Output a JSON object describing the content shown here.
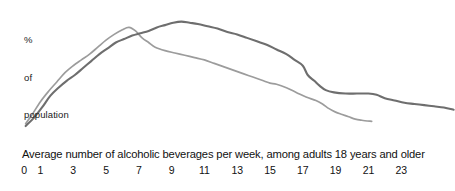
{
  "chart_data": {
    "type": "line",
    "title": "",
    "subtitle": "",
    "xlabel": "Average number of alcoholic beverages per week, among adults 18 years and older",
    "ylabel": "% of population",
    "ylabel_lines": [
      "%",
      "of",
      "population"
    ],
    "grid": false,
    "legend_position": "none",
    "xlim": [
      0,
      26
    ],
    "ylim": [
      0,
      100
    ],
    "xticks": [
      0,
      1,
      3,
      5,
      7,
      9,
      11,
      13,
      15,
      17,
      19,
      21,
      23
    ],
    "xtick_labels": [
      "0",
      "1",
      "3",
      "5",
      "7",
      "9",
      "11",
      "13",
      "15",
      "17",
      "19",
      "21",
      "23"
    ],
    "yticks": [],
    "ytick_labels": [],
    "series": [
      {
        "name": "light-gray-series",
        "color": "#9c9c9c",
        "x": [
          0.1,
          0.5,
          1.0,
          1.5,
          2.0,
          2.5,
          3.0,
          3.5,
          4.0,
          4.5,
          5.0,
          5.5,
          6.0,
          6.4,
          6.8,
          7.2,
          7.6,
          8.0,
          8.6,
          9.2,
          9.8,
          10.4,
          11.0,
          11.6,
          12.2,
          12.8,
          13.4,
          14.0,
          14.6,
          15.0,
          15.4,
          16.0,
          16.6,
          17.2,
          17.8,
          18.2,
          18.6,
          19.0,
          19.4,
          19.8,
          20.2,
          20.6,
          21.2
        ],
        "y": [
          8,
          16,
          27,
          36,
          44,
          52,
          58,
          63,
          68,
          74,
          80,
          85,
          89,
          91,
          88,
          82,
          78,
          74,
          71,
          69,
          67,
          65,
          63,
          60,
          57,
          54,
          51,
          48,
          45,
          43,
          42,
          39,
          35,
          31,
          28,
          25,
          21,
          18,
          16,
          14,
          12,
          11,
          10
        ]
      },
      {
        "name": "dark-gray-series",
        "color": "#6e6e6e",
        "x": [
          0.1,
          0.6,
          1.1,
          1.6,
          2.1,
          2.6,
          3.1,
          3.6,
          4.1,
          4.6,
          5.1,
          5.6,
          6.1,
          6.6,
          7.1,
          7.6,
          8.1,
          8.6,
          9.1,
          9.6,
          10.1,
          10.6,
          11.2,
          11.8,
          12.4,
          13.0,
          13.6,
          14.2,
          14.8,
          15.4,
          16.0,
          16.5,
          17.0,
          17.3,
          17.7,
          18.0,
          18.4,
          18.9,
          19.6,
          20.3,
          21.0,
          21.5,
          22.0,
          22.6,
          23.2,
          23.8,
          24.4,
          25.0,
          25.6,
          26.2
        ],
        "y": [
          6,
          13,
          22,
          32,
          39,
          45,
          50,
          56,
          62,
          68,
          73,
          78,
          81,
          84,
          86,
          88,
          91,
          93,
          95,
          96,
          95,
          94,
          92,
          90,
          87,
          85,
          82,
          79,
          76,
          72,
          68,
          63,
          58,
          50,
          45,
          41,
          37,
          35,
          34,
          34,
          34,
          33,
          30,
          28,
          26,
          25,
          24,
          23,
          22,
          20
        ]
      }
    ],
    "colors": {
      "series_light": "#9c9c9c",
      "series_dark": "#6e6e6e",
      "background": "#ffffff",
      "text": "#111111"
    }
  }
}
